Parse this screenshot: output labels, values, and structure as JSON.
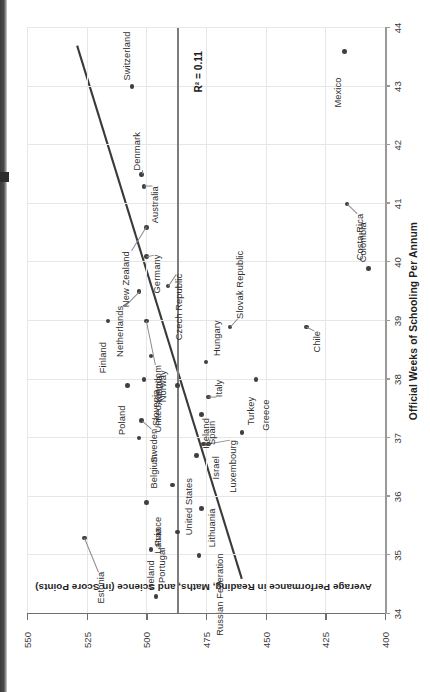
{
  "chart_data": {
    "type": "scatter",
    "title": "",
    "xlabel": "Official Weeks of Schooling Per Annum",
    "ylabel": "Average Performance in Reading, Maths, and Science (in Score Points)",
    "xlim": [
      34,
      44
    ],
    "ylim": [
      400,
      550
    ],
    "xticks": [
      34,
      35,
      36,
      37,
      38,
      39,
      40,
      41,
      42,
      43,
      44
    ],
    "yticks": [
      400,
      425,
      450,
      475,
      500,
      525,
      550
    ],
    "grid": true,
    "legend": null,
    "annotations": [
      {
        "name": "r2",
        "text": "R² = 0.11"
      }
    ],
    "reference_line": {
      "axis": "y",
      "value": 487,
      "style": "solid-gray",
      "label": ""
    },
    "trend_line": {
      "type": "linear",
      "x_start": 34.6,
      "y_start": 460,
      "x_end": 43.7,
      "y_end": 529,
      "r2": 0.11
    },
    "points": [
      {
        "label": "Estonia",
        "x": 35.3,
        "y": 526,
        "lx": -48,
        "ly": 18,
        "leader": true
      },
      {
        "label": "Ireland",
        "x": 34.3,
        "y": 496,
        "lx": 7,
        "ly": -4,
        "leader": false
      },
      {
        "label": "Portugal",
        "x": 35.1,
        "y": 498,
        "lx": -12,
        "ly": 12,
        "leader": false
      },
      {
        "label": "Latvia",
        "x": 35.4,
        "y": 487,
        "lx": -10,
        "ly": -18,
        "leader": false
      },
      {
        "label": "Lithuania",
        "x": 35.8,
        "y": 477,
        "lx": -14,
        "ly": 12,
        "leader": false
      },
      {
        "label": "Russian Federation",
        "x": 35.0,
        "y": 478,
        "lx": -12,
        "ly": 22,
        "leader": false
      },
      {
        "label": "France",
        "x": 35.9,
        "y": 500,
        "lx": -28,
        "ly": 13,
        "leader": false
      },
      {
        "label": "Belgium",
        "x": 37.0,
        "y": 503,
        "lx": -30,
        "ly": 16,
        "leader": false
      },
      {
        "label": "United States",
        "x": 36.2,
        "y": 489,
        "lx": -7,
        "ly": 17,
        "leader": false
      },
      {
        "label": "Iceland",
        "x": 36.7,
        "y": 479,
        "lx": 7,
        "ly": 11,
        "leader": false
      },
      {
        "label": "Israel",
        "x": 36.9,
        "y": 476,
        "lx": -26,
        "ly": 13,
        "leader": false
      },
      {
        "label": "Luxembourg",
        "x": 36.9,
        "y": 474,
        "lx": -10,
        "ly": 26,
        "leader": true
      },
      {
        "label": "Poland",
        "x": 37.9,
        "y": 508,
        "lx": -34,
        "ly": -4,
        "leader": false
      },
      {
        "label": "Sweden",
        "x": 37.3,
        "y": 502,
        "lx": -22,
        "ly": 13,
        "leader": true
      },
      {
        "label": "Spain",
        "x": 37.4,
        "y": 477,
        "lx": -20,
        "ly": 12,
        "leader": false
      },
      {
        "label": "Turkey",
        "x": 37.1,
        "y": 460,
        "lx": 7,
        "ly": 10,
        "leader": false
      },
      {
        "label": "Italy",
        "x": 37.7,
        "y": 474,
        "lx": 0,
        "ly": 12,
        "leader": true
      },
      {
        "label": "Greece",
        "x": 38.0,
        "y": 454,
        "lx": -34,
        "ly": 11,
        "leader": false
      },
      {
        "label": "Slovenia",
        "x": 38.0,
        "y": 501,
        "lx": -24,
        "ly": 13,
        "leader": false
      },
      {
        "label": "Austria",
        "x": 37.9,
        "y": 487,
        "lx": -4,
        "ly": -17,
        "leader": false
      },
      {
        "label": "Norway",
        "x": 38.4,
        "y": 498,
        "lx": -28,
        "ly": 13,
        "leader": false
      },
      {
        "label": "Hungary",
        "x": 38.3,
        "y": 475,
        "lx": 6,
        "ly": 12,
        "leader": false
      },
      {
        "label": "United Kingdom",
        "x": 39.0,
        "y": 500,
        "lx": -58,
        "ly": 13,
        "leader": true
      },
      {
        "label": "Finland",
        "x": 39.0,
        "y": 516,
        "lx": -35,
        "ly": -4,
        "leader": false
      },
      {
        "label": "Slovak Republic",
        "x": 38.9,
        "y": 465,
        "lx": 8,
        "ly": 11,
        "leader": true
      },
      {
        "label": "Chile",
        "x": 38.9,
        "y": 433,
        "lx": -18,
        "ly": 12,
        "leader": true
      },
      {
        "label": "Netherlands",
        "x": 39.5,
        "y": 503,
        "lx": -28,
        "ly": -18,
        "leader": true
      },
      {
        "label": "Czech Republic",
        "x": 39.6,
        "y": 491,
        "lx": -2,
        "ly": 12,
        "leader": true
      },
      {
        "label": "Germany",
        "x": 40.1,
        "y": 500,
        "lx": -12,
        "ly": 12,
        "leader": true
      },
      {
        "label": "New Zealand",
        "x": 40.6,
        "y": 500,
        "lx": -38,
        "ly": -19,
        "leader": true
      },
      {
        "label": "Colombia",
        "x": 39.9,
        "y": 407,
        "lx": 6,
        "ly": -4,
        "leader": false
      },
      {
        "label": "Costa Rica",
        "x": 41.0,
        "y": 416,
        "lx": -24,
        "ly": 14,
        "leader": true
      },
      {
        "label": "Australia",
        "x": 41.3,
        "y": 501,
        "lx": -14,
        "ly": 12,
        "leader": true
      },
      {
        "label": "Denmark",
        "x": 41.5,
        "y": 502,
        "lx": 4,
        "ly": -4,
        "leader": true
      },
      {
        "label": "Switzerland",
        "x": 43.0,
        "y": 506,
        "lx": 6,
        "ly": -4,
        "leader": false
      },
      {
        "label": "Mexico",
        "x": 43.6,
        "y": 417,
        "lx": -40,
        "ly": -5,
        "leader": false
      }
    ]
  },
  "axes": {
    "x_title": "Official Weeks of Schooling Per Annum",
    "y_title": "Average Performance in Reading, Maths, and Science (in Score Points)",
    "x_tick_labels": [
      "34",
      "35",
      "36",
      "37",
      "38",
      "39",
      "40",
      "41",
      "42",
      "43",
      "44"
    ],
    "y_tick_labels": [
      "400",
      "425",
      "450",
      "475",
      "500",
      "525",
      "550"
    ]
  },
  "annotation": {
    "r2_text": "R² = 0.11"
  },
  "colors": {
    "point": "#3f3f3f",
    "trend_line": "#3a3a3a",
    "reference_line": "#7d7d7d",
    "grid": "#e6e6e6",
    "axis": "#9a9a9a",
    "text": "#2f2f2f"
  }
}
